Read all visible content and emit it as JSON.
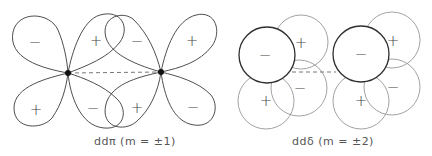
{
  "diagrams": [
    {
      "id": "dd-pi",
      "caption": "ddπ (m = ±1)",
      "nuclei": [
        [
          68,
          73
        ],
        [
          161,
          72
        ]
      ],
      "lobes": [
        {
          "sign": "−",
          "label_pos": [
            35,
            42
          ]
        },
        {
          "sign": "+",
          "label_pos": [
            96,
            41
          ]
        },
        {
          "sign": "+",
          "label_pos": [
            36,
            110
          ]
        },
        {
          "sign": "−",
          "label_pos": [
            93,
            108
          ]
        },
        {
          "sign": "−",
          "label_pos": [
            137,
            41
          ]
        },
        {
          "sign": "+",
          "label_pos": [
            192,
            41
          ]
        },
        {
          "sign": "+",
          "label_pos": [
            137,
            108
          ]
        },
        {
          "sign": "−",
          "label_pos": [
            193,
            107
          ]
        }
      ]
    },
    {
      "id": "dd-delta",
      "caption": "ddδ (m = ±2)",
      "groups": [
        {
          "circles": [
            {
              "sign": "+",
              "cx": 301,
              "cy": 42,
              "bold": false
            },
            {
              "sign": "−",
              "cx": 299,
              "cy": 88,
              "bold": false
            },
            {
              "sign": "+",
              "cx": 266,
              "cy": 101,
              "bold": false
            },
            {
              "sign": "−",
              "cx": 267,
              "cy": 55,
              "bold": true
            }
          ]
        },
        {
          "circles": [
            {
              "sign": "+",
              "cx": 392,
              "cy": 40,
              "bold": false
            },
            {
              "sign": "−",
              "cx": 392,
              "cy": 87,
              "bold": false
            },
            {
              "sign": "+",
              "cx": 361,
              "cy": 101,
              "bold": false
            },
            {
              "sign": "−",
              "cx": 361,
              "cy": 54,
              "bold": true
            }
          ]
        }
      ]
    }
  ],
  "labels": {
    "pi_caption": "ddπ (m = ±1)",
    "delta_caption": "ddδ (m = ±2)",
    "minus": "−",
    "plus": "+"
  }
}
